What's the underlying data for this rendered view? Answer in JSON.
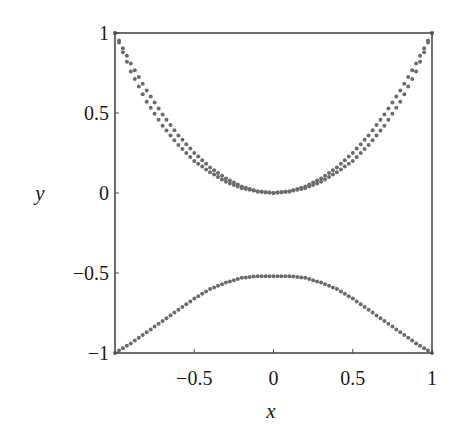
{
  "chart_data": {
    "type": "scatter",
    "title": "",
    "xlabel": "x",
    "ylabel": "y",
    "xlim": [
      -1,
      1
    ],
    "ylim": [
      -1,
      1
    ],
    "grid": false,
    "legend": null,
    "x_ticks": [
      {
        "value": -0.5,
        "label": "−0.5"
      },
      {
        "value": 0,
        "label": "0"
      },
      {
        "value": 0.5,
        "label": "0.5"
      },
      {
        "value": 1,
        "label": "1"
      }
    ],
    "y_ticks": [
      {
        "value": 1,
        "label": "1"
      },
      {
        "value": 0.5,
        "label": "0.5"
      },
      {
        "value": 0,
        "label": "0"
      },
      {
        "value": -0.5,
        "label": "−0.5"
      },
      {
        "value": -1,
        "label": "−1"
      }
    ],
    "marker_color": "#6b6b6b",
    "frame_color": "#4a4a4a",
    "series": [
      {
        "name": "upper-inner",
        "description": "dotted parabola-like curve through (-1,1), (0,0), (1,1)",
        "x": [
          -1,
          -0.9,
          -0.8,
          -0.7,
          -0.6,
          -0.5,
          -0.4,
          -0.3,
          -0.2,
          -0.1,
          0,
          0.1,
          0.2,
          0.3,
          0.4,
          0.5,
          0.6,
          0.7,
          0.8,
          0.9,
          1
        ],
        "y": [
          1,
          0.81,
          0.64,
          0.49,
          0.36,
          0.25,
          0.16,
          0.09,
          0.04,
          0.01,
          0,
          0.01,
          0.04,
          0.09,
          0.16,
          0.25,
          0.36,
          0.49,
          0.64,
          0.81,
          1
        ]
      },
      {
        "name": "upper-outer",
        "description": "second dotted curve slightly below the first, same endpoints",
        "x": [
          -1,
          -0.9,
          -0.8,
          -0.7,
          -0.6,
          -0.5,
          -0.4,
          -0.3,
          -0.2,
          -0.1,
          0,
          0.1,
          0.2,
          0.3,
          0.4,
          0.5,
          0.6,
          0.7,
          0.8,
          0.9,
          1
        ],
        "y": [
          1,
          0.76,
          0.57,
          0.42,
          0.3,
          0.2,
          0.13,
          0.07,
          0.03,
          0.01,
          0,
          0.01,
          0.03,
          0.07,
          0.13,
          0.2,
          0.3,
          0.42,
          0.57,
          0.76,
          1
        ]
      },
      {
        "name": "lower",
        "description": "dotted bell-shaped curve from (-1,-1) peaking near (0,-0.52)",
        "x": [
          -1,
          -0.9,
          -0.8,
          -0.7,
          -0.6,
          -0.5,
          -0.4,
          -0.3,
          -0.2,
          -0.1,
          0,
          0.1,
          0.2,
          0.3,
          0.4,
          0.5,
          0.6,
          0.7,
          0.8,
          0.9,
          1
        ],
        "y": [
          -1,
          -0.94,
          -0.87,
          -0.8,
          -0.73,
          -0.66,
          -0.6,
          -0.56,
          -0.53,
          -0.52,
          -0.52,
          -0.52,
          -0.53,
          -0.56,
          -0.6,
          -0.66,
          -0.73,
          -0.8,
          -0.87,
          -0.94,
          -1
        ]
      }
    ]
  }
}
